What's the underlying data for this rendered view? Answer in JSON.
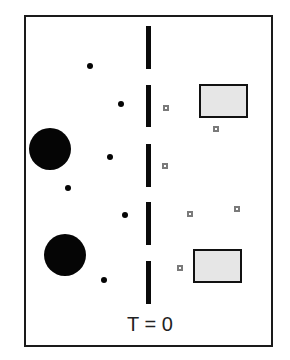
{
  "figure": {
    "frame": {
      "x": 24,
      "y": 15,
      "w": 249,
      "h": 332
    },
    "time_label": "T = 0",
    "time_label_pos": {
      "cx": 150,
      "y": 313
    },
    "colors": {
      "frame": "#1a1a1a",
      "barrier": "#0a0a0a",
      "particle": "#050505",
      "target_fill": "#e6e6e6",
      "target_border": "#111111",
      "marker": "#7a7a7a"
    },
    "barrier_segments": [
      {
        "x": 146,
        "y": 26,
        "w": 5,
        "h": 43
      },
      {
        "x": 146,
        "y": 85,
        "w": 5,
        "h": 42
      },
      {
        "x": 146,
        "y": 144,
        "w": 5,
        "h": 43
      },
      {
        "x": 146,
        "y": 202,
        "w": 5,
        "h": 43
      },
      {
        "x": 146,
        "y": 261,
        "w": 5,
        "h": 43
      }
    ],
    "large_circles": [
      {
        "cx": 50,
        "cy": 149,
        "r": 21
      },
      {
        "cx": 65,
        "cy": 255,
        "r": 21
      }
    ],
    "small_dots": [
      {
        "cx": 90,
        "cy": 66,
        "r": 3
      },
      {
        "cx": 121,
        "cy": 104,
        "r": 3
      },
      {
        "cx": 110,
        "cy": 157,
        "r": 3
      },
      {
        "cx": 68,
        "cy": 188,
        "r": 3
      },
      {
        "cx": 125,
        "cy": 215,
        "r": 3
      },
      {
        "cx": 104,
        "cy": 280,
        "r": 3
      }
    ],
    "target_rects": [
      {
        "x": 199,
        "y": 84,
        "w": 49,
        "h": 34
      },
      {
        "x": 193,
        "y": 249,
        "w": 49,
        "h": 34
      }
    ],
    "square_markers": [
      {
        "x": 163,
        "y": 105,
        "s": 6
      },
      {
        "x": 213,
        "y": 126,
        "s": 6
      },
      {
        "x": 162,
        "y": 163,
        "s": 6
      },
      {
        "x": 187,
        "y": 211,
        "s": 6
      },
      {
        "x": 234,
        "y": 206,
        "s": 6
      },
      {
        "x": 177,
        "y": 265,
        "s": 6
      }
    ]
  }
}
